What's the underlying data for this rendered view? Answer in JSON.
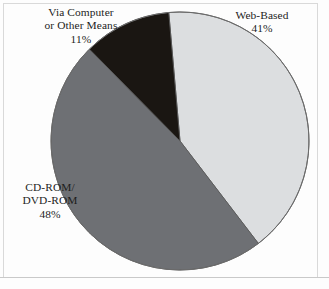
{
  "figure": {
    "background_color": "#fdfdfd",
    "frame_color": "#d9d9d9",
    "text_color": "#1d1d1d"
  },
  "chart_data": {
    "type": "pie",
    "title": "",
    "subtitle": "",
    "xlabel": "",
    "ylabel": "",
    "legend_position": "none",
    "grid": false,
    "categories": [
      "Web-Based",
      "CD-ROM/ DVD-ROM",
      "Via Computer or Other Means"
    ],
    "values": [
      41,
      48,
      11
    ],
    "value_suffix": "%",
    "colors": [
      "#dcdee0",
      "#6e7074",
      "#1a1612"
    ],
    "start_angle_deg": -5,
    "direction": "clockwise",
    "slices": [
      {
        "id": "web-based",
        "label_lines": [
          "Web-Based"
        ],
        "value": 41,
        "value_text": "41%",
        "color": "#dcdee0",
        "edge_color": "#5a5a5a"
      },
      {
        "id": "cd-rom-dvd-rom",
        "label_lines": [
          "CD-ROM/",
          "DVD-ROM"
        ],
        "value": 48,
        "value_text": "48%",
        "color": "#6e7074",
        "edge_color": "#5a5a5a"
      },
      {
        "id": "via-computer-or-other-means",
        "label_lines": [
          "Via Computer",
          "or Other Means"
        ],
        "value": 11,
        "value_text": "11%",
        "color": "#1a1612",
        "edge_color": "#5a5a5a"
      }
    ]
  }
}
